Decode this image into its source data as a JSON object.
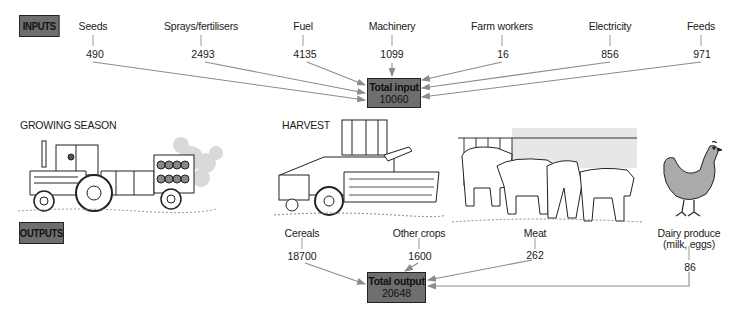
{
  "inputs_tag": "INPUTS",
  "outputs_tag": "OUTPUTS",
  "inputs": [
    {
      "label": "Seeds",
      "value": "490"
    },
    {
      "label": "Sprays/fertilisers",
      "value": "2493"
    },
    {
      "label": "Fuel",
      "value": "4135"
    },
    {
      "label": "Machinery",
      "value": "1099"
    },
    {
      "label": "Farm workers",
      "value": "16"
    },
    {
      "label": "Electricity",
      "value": "856"
    },
    {
      "label": "Feeds",
      "value": "971"
    }
  ],
  "total_input": {
    "label": "Total input",
    "value": "10060"
  },
  "sections": {
    "growing": "GROWING SEASON",
    "harvest": "HARVEST"
  },
  "outputs": [
    {
      "label": "Cereals",
      "value": "18700"
    },
    {
      "label": "Other crops",
      "value": "1600"
    },
    {
      "label": "Meat",
      "value": "262"
    },
    {
      "label": "Dairy produce",
      "label2": "(milk, eggs)",
      "value": "86"
    }
  ],
  "total_output": {
    "label": "Total output",
    "value": "20648"
  },
  "illustrations": [
    "tractor-with-spreader",
    "combine-harvester",
    "cattle-at-feeding-rack",
    "hen"
  ],
  "colors": {
    "box_fill": "#6e6e6e",
    "arrow": "#8c8c8c",
    "text": "#1a1a1a"
  }
}
